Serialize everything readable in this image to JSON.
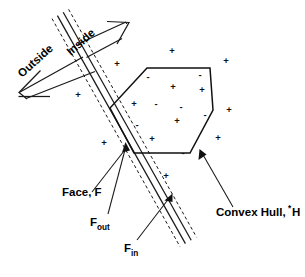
{
  "figure": {
    "background_color": "#ffffff",
    "ink_color": "#111111",
    "width": 305,
    "height": 277
  },
  "labels": {
    "outside": "Outside",
    "inside": "Inside",
    "face": "Face, F",
    "f_out_base": "F",
    "f_out_sub": "out",
    "f_in_base": "F",
    "f_in_sub": "in",
    "convex_hull_base": "Convex Hull,  H",
    "convex_hull_sup": "*"
  },
  "markers": {
    "plus_glyph": "+",
    "minus_glyph": "-",
    "inside_points": [
      {
        "x": 148,
        "y": 77,
        "sign": "-"
      },
      {
        "x": 200,
        "y": 75,
        "sign": "-"
      },
      {
        "x": 173,
        "y": 87,
        "sign": "+"
      },
      {
        "x": 202,
        "y": 90,
        "sign": "+"
      },
      {
        "x": 156,
        "y": 104,
        "sign": "-"
      },
      {
        "x": 181,
        "y": 107,
        "sign": "-"
      },
      {
        "x": 205,
        "y": 115,
        "sign": "-"
      },
      {
        "x": 137,
        "y": 125,
        "sign": "-"
      },
      {
        "x": 177,
        "y": 121,
        "sign": "+"
      },
      {
        "x": 152,
        "y": 139,
        "sign": "+"
      },
      {
        "x": 183,
        "y": 153,
        "sign": "-"
      }
    ],
    "outside_points": [
      {
        "x": 172,
        "y": 51,
        "sign": "+"
      },
      {
        "x": 117,
        "y": 64,
        "sign": "+"
      },
      {
        "x": 226,
        "y": 61,
        "sign": "+"
      },
      {
        "x": 78,
        "y": 95,
        "sign": "+"
      },
      {
        "x": 134,
        "y": 104,
        "sign": "+"
      },
      {
        "x": 229,
        "y": 110,
        "sign": "+"
      },
      {
        "x": 104,
        "y": 143,
        "sign": "+"
      },
      {
        "x": 218,
        "y": 138,
        "sign": "+"
      },
      {
        "x": 166,
        "y": 176,
        "sign": "+"
      }
    ]
  },
  "hull": {
    "name": "convex-hull-hexagon",
    "vertices": [
      [
        147,
        68
      ],
      [
        210,
        68
      ],
      [
        213,
        110
      ],
      [
        190,
        153
      ],
      [
        134,
        153
      ],
      [
        110,
        108
      ]
    ]
  },
  "face_band": {
    "name": "face-band",
    "center_line": [
      [
        60,
        14
      ],
      [
        188,
        242
      ]
    ],
    "offsets_px": [
      -9,
      -4.5,
      4.5,
      9
    ]
  },
  "leaders": {
    "face": {
      "from": [
        92,
        192
      ],
      "to": [
        123,
        152
      ]
    },
    "f_out": {
      "from": [
        108,
        218
      ],
      "to": [
        124,
        144
      ]
    },
    "f_in": {
      "from": [
        137,
        244
      ],
      "to": [
        170,
        198
      ]
    },
    "convex_hull": {
      "from": [
        232,
        208
      ],
      "to": [
        200,
        152
      ]
    }
  },
  "direction_arrows": {
    "outside": {
      "label_angle": -42,
      "points_to": "lower-left"
    },
    "inside": {
      "label_angle": -42,
      "points_to": "upper-right"
    }
  }
}
